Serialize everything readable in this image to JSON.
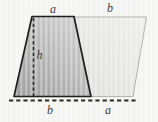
{
  "figure": {
    "type": "geometry-diagram",
    "description_semantic": "two congruent trapezoids forming a parallelogram",
    "labels": {
      "top_left_side": "a",
      "top_right_side": "b",
      "height": "h",
      "bottom_left_side": "b",
      "bottom_right_side": "a"
    },
    "colors": {
      "background": "#f3f3f1",
      "stripe_overlay": "#ffffff",
      "dark_trapezoid_fill_dark": "#9c9c9c",
      "dark_trapezoid_fill_light": "#cfcfcf",
      "dark_trapezoid_outline": "#1f1f1f",
      "light_half_fill_dark": "#dfdfdd",
      "light_half_fill_light": "#ececea",
      "light_half_outline": "#b2b2b0",
      "dash_line_color": "#2b2b2b",
      "label_color": "#3b3b3b"
    }
  }
}
